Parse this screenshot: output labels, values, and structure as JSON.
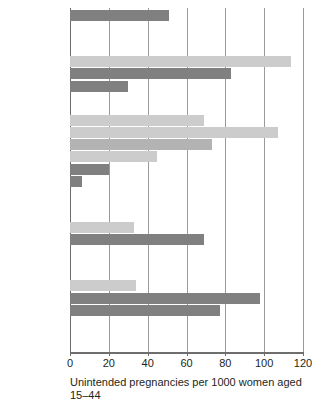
{
  "chart_data": {
    "type": "bar",
    "orientation": "horizontal",
    "title": "",
    "xlabel": "Unintended pregnancies per 1000 women aged 15–44",
    "ylabel": "",
    "xlim": [
      0,
      120
    ],
    "xticks": [
      0,
      20,
      40,
      60,
      80,
      100,
      120
    ],
    "xticklabels": [
      "0",
      "20",
      "40",
      "60",
      "80",
      "100",
      "120"
    ],
    "grid": "vertical",
    "legend": "none",
    "colors": {
      "light": "#cccccc",
      "medium": "#b3b3b3",
      "dark": "#808080",
      "grid": "#9a9a9a",
      "text": "#231f20"
    },
    "groups": [
      {
        "heading": "",
        "items": [
          {
            "label": "All women",
            "value": 51,
            "shade": "dark"
          }
        ]
      },
      {
        "heading": "% of\npoverty",
        "items": [
          {
            "label": "<100",
            "value": 114,
            "shade": "light"
          },
          {
            "label": "100–199",
            "value": 83,
            "shade": "dark"
          },
          {
            "label": "≥200",
            "value": 30,
            "shade": "dark"
          }
        ]
      },
      {
        "heading": "Age",
        "items": [
          {
            "label": "15–19",
            "value": 69,
            "shade": "light"
          },
          {
            "label": "20–24",
            "value": 107,
            "shade": "light"
          },
          {
            "label": "25–29",
            "value": 73,
            "shade": "medium"
          },
          {
            "label": "30–34",
            "value": 45,
            "shade": "light"
          },
          {
            "label": "35–39",
            "value": 20,
            "shade": "dark"
          },
          {
            "label": "≥40*",
            "value": 6,
            "shade": "dark"
          }
        ]
      },
      {
        "heading": "Marital\nstatus",
        "items": [
          {
            "label": "Married",
            "value": 33,
            "shade": "light"
          },
          {
            "label": "Unmarried",
            "value": 69,
            "shade": "dark"
          }
        ]
      },
      {
        "heading": "Race/\nethnicity",
        "items": [
          {
            "label": "White",
            "value": 34,
            "shade": "light"
          },
          {
            "label": "Black",
            "value": 98,
            "shade": "dark"
          },
          {
            "label": "Hispanic",
            "value": 77,
            "shade": "dark"
          }
        ]
      }
    ]
  }
}
